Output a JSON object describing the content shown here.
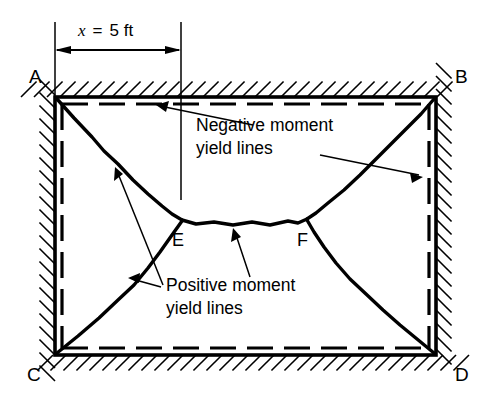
{
  "figure": {
    "background_color": "#ffffff",
    "ink_color": "#000000",
    "width": 487,
    "height": 404
  },
  "dimension": {
    "variable": "x",
    "equals": "=",
    "value": "5 ft",
    "full_label": "x = 5 ft",
    "from_x": 55,
    "to_x": 181,
    "line_y": 50
  },
  "corners": [
    {
      "id": "A",
      "label": "A",
      "x": 55,
      "y": 97,
      "label_x": 29,
      "label_y": 83
    },
    {
      "id": "B",
      "label": "B",
      "x": 436,
      "y": 97,
      "label_x": 455,
      "label_y": 83
    },
    {
      "id": "C",
      "label": "C",
      "x": 55,
      "y": 355,
      "label_x": 27,
      "label_y": 380
    },
    {
      "id": "D",
      "label": "D",
      "x": 436,
      "y": 355,
      "label_x": 455,
      "label_y": 380
    }
  ],
  "nodes": [
    {
      "id": "E",
      "label": "E",
      "x": 182,
      "y": 220,
      "label_x": 172,
      "label_y": 245
    },
    {
      "id": "F",
      "label": "F",
      "x": 307,
      "y": 219,
      "label_x": 297,
      "label_y": 245
    }
  ],
  "annotations": [
    {
      "id": "negative-moment",
      "line1": "Negative moment",
      "line2": "yield lines",
      "text_x": 196,
      "text_y1": 131,
      "text_y2": 154,
      "leaders": [
        {
          "from_x": 253,
          "from_y": 125,
          "to_x": 156,
          "to_y": 105
        },
        {
          "from_x": 320,
          "from_y": 155,
          "to_x": 423,
          "to_y": 177
        }
      ]
    },
    {
      "id": "positive-moment",
      "line1": "Positive moment",
      "line2": "yield lines",
      "text_x": 166,
      "text_y1": 291,
      "text_y2": 314,
      "leaders": [
        {
          "from_x": 163,
          "from_y": 285,
          "to_x": 115,
          "to_y": 167
        },
        {
          "from_x": 160,
          "from_y": 287,
          "to_x": 128,
          "to_y": 279
        },
        {
          "from_x": 250,
          "from_y": 277,
          "to_x": 233,
          "to_y": 228
        }
      ]
    }
  ],
  "boundary": {
    "description": "Rectangular slab fixed (hatched) on all four edges",
    "left": 55,
    "top": 97,
    "right": 436,
    "bottom": 355,
    "hatch_spacing": 13,
    "hatch_length": 22
  },
  "negative_yield_lines": [
    {
      "id": "top-edge",
      "x1": 62,
      "y1": 104,
      "x2": 429,
      "y2": 104
    },
    {
      "id": "bottom-edge",
      "x1": 62,
      "y1": 348,
      "x2": 429,
      "y2": 348
    },
    {
      "id": "left-edge",
      "x1": 62,
      "y1": 104,
      "x2": 62,
      "y2": 348
    },
    {
      "id": "right-edge",
      "x1": 429,
      "y1": 104,
      "x2": 429,
      "y2": 348
    }
  ],
  "positive_yield_lines": [
    {
      "id": "A-E",
      "from": "A",
      "to": "E"
    },
    {
      "id": "C-E",
      "from": "C",
      "to": "E"
    },
    {
      "id": "E-F",
      "from": "E",
      "to": "F"
    },
    {
      "id": "B-F",
      "from": "B",
      "to": "F"
    },
    {
      "id": "D-F",
      "from": "D",
      "to": "F"
    }
  ],
  "legend": {
    "negative_style": "dashed",
    "positive_style": "solid-irregular"
  }
}
